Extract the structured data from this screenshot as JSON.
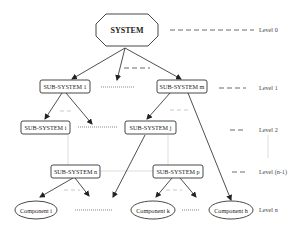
{
  "diagram": {
    "root": {
      "label": "SYSTEM",
      "shape": "octagon"
    },
    "level1": [
      {
        "label": "SUB-SYSTEM 1"
      },
      {
        "label": "SUB-SYSTEM m"
      }
    ],
    "level2": [
      {
        "label": "SUB-SYSTEM i"
      },
      {
        "label": "SUB-SYSTEM j"
      }
    ],
    "level_n_minus_1": [
      {
        "label": "SUB-SYSTEM n"
      },
      {
        "label": "SUB-SYSTEM p"
      }
    ],
    "components": [
      {
        "label": "Component i"
      },
      {
        "label": "Component k"
      },
      {
        "label": "Component h"
      }
    ],
    "levels": [
      {
        "label": "Level 0"
      },
      {
        "label": "Level 1"
      },
      {
        "label": "Level 2"
      },
      {
        "label": "Level (n-1)"
      },
      {
        "label": "Level n"
      }
    ],
    "colors": {
      "stroke": "#333333",
      "faint_line": "#cfcfcf",
      "background": "#ffffff"
    }
  }
}
